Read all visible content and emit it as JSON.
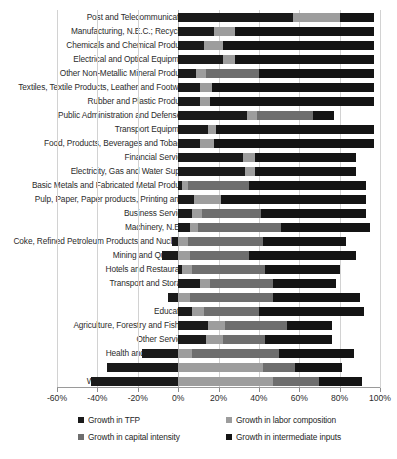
{
  "chart_data": {
    "type": "bar",
    "subtype": "stacked-horizontal",
    "title": "",
    "xlabel": "",
    "ylabel": "",
    "xlim": [
      -60,
      100
    ],
    "xticks": [
      "-60%",
      "-40%",
      "-20%",
      "0%",
      "20%",
      "40%",
      "60%",
      "80%",
      "100%"
    ],
    "xtick_values": [
      -60,
      -40,
      -20,
      0,
      20,
      40,
      60,
      80,
      100
    ],
    "grid": true,
    "legend_position": "bottom",
    "series": [
      {
        "name": "Growth in TFP",
        "color": "#1a1a1a"
      },
      {
        "name": "Growth in labor composition",
        "color": "#9d9d9d"
      },
      {
        "name": "Growth in capital intensity",
        "color": "#6e6e6e"
      },
      {
        "name": "Growth in intermediate inputs",
        "color": "#141414"
      }
    ],
    "categories": [
      "Post and Telecommunication",
      "Manufacturing, N.E.C.; Recycling",
      "Chemicals and  Chemical Products",
      "Electrical and Optical Equipment",
      "Other Non-Metallic Mineral Products",
      "Textiles, Textile Products, Leather and Footwear",
      "Rubber and Plastic Products",
      "Public Administration and Defense;...",
      "Transport Equipment",
      "Food, Products, Beverages and Tobacco",
      "Financial Services",
      "Electricity, Gas and Water Supply",
      "Basic Metals and Fabricated Metal Products",
      "Pulp, Paper, Paper products, Printing and...",
      "Business Services",
      "Machinery, N.E.C.",
      "Coke, Refined Petroleum Products and Nuclear...",
      "Mining and Quarrying",
      "Hotels and Restaurants",
      "Transport and Storage",
      "Trade",
      "Education",
      "Agriculture, Forestry and Fishing",
      "Other Services",
      "Health and Social Work",
      "Construction",
      "Wood and Products of Wood"
    ],
    "values": {
      "Growth in TFP": [
        57,
        18,
        13,
        22,
        9,
        11,
        11,
        34,
        15,
        11,
        32,
        33,
        2,
        8,
        7,
        6,
        -3,
        -8,
        2,
        11,
        -5,
        7,
        15,
        14,
        -18,
        -35,
        -43
      ],
      "Growth in labor composition": [
        23,
        10,
        9,
        6,
        5,
        6,
        5,
        5,
        4,
        7,
        6,
        5,
        3,
        13,
        5,
        4,
        5,
        6,
        5,
        5,
        6,
        6,
        8,
        8,
        7,
        42,
        47
      ],
      "Growth in capital intensity": [
        0,
        0,
        0,
        0,
        26,
        0,
        0,
        28,
        0,
        0,
        0,
        0,
        30,
        0,
        29,
        41,
        37,
        29,
        36,
        31,
        41,
        27,
        31,
        21,
        43,
        16,
        23
      ],
      "Growth in intermediate inputs": [
        17,
        69,
        75,
        69,
        57,
        80,
        81,
        10,
        78,
        79,
        50,
        50,
        58,
        72,
        52,
        44,
        41,
        53,
        37,
        31,
        43,
        52,
        22,
        33,
        37,
        23,
        21
      ]
    }
  },
  "legend": {
    "items": [
      "Growth in TFP",
      "Growth in labor composition",
      "Growth in capital intensity",
      "Growth in intermediate inputs"
    ]
  }
}
